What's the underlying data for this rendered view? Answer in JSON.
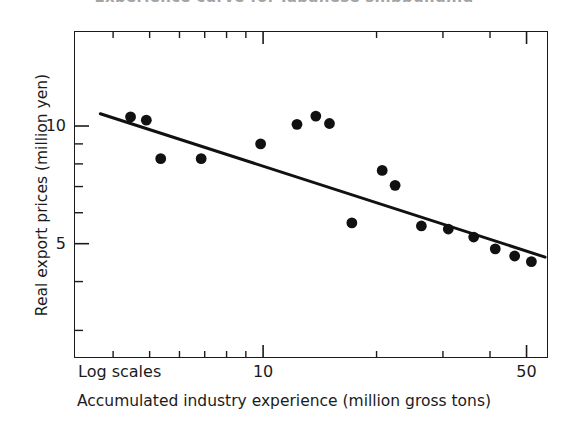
{
  "figure": {
    "cropped_title_remnant": "Experience curve for Japanese shipbuilding",
    "background_color": "#ffffff",
    "ink_color": "#1b1b1b"
  },
  "chart_data": {
    "type": "scatter",
    "title": "",
    "xlabel": "Accumulated industry experience (million gross tons)",
    "ylabel": "Real export prices (million yen)",
    "xscale": "log",
    "yscale": "log",
    "xlim": [
      3.15,
      57.0
    ],
    "ylim": [
      2.55,
      17.5
    ],
    "grid": false,
    "legend": null,
    "log_scale_note": "Log scales",
    "xticks_major": [
      10,
      50
    ],
    "xtick_labels": [
      "10",
      "50"
    ],
    "xticks_minor": [
      4,
      5,
      6,
      7,
      8,
      9,
      20,
      30,
      40,
      60
    ],
    "yticks_major": [
      5,
      10
    ],
    "ytick_labels": [
      "5",
      "10"
    ],
    "yticks_minor": [
      3,
      4,
      6,
      7,
      8,
      9
    ],
    "points": [
      {
        "x": 4.45,
        "y": 10.55
      },
      {
        "x": 4.9,
        "y": 10.35
      },
      {
        "x": 5.35,
        "y": 8.25
      },
      {
        "x": 6.85,
        "y": 8.25
      },
      {
        "x": 9.85,
        "y": 9.0
      },
      {
        "x": 12.3,
        "y": 10.1
      },
      {
        "x": 13.8,
        "y": 10.6
      },
      {
        "x": 15.0,
        "y": 10.15
      },
      {
        "x": 17.2,
        "y": 5.65
      },
      {
        "x": 20.7,
        "y": 7.7
      },
      {
        "x": 22.4,
        "y": 7.05
      },
      {
        "x": 26.3,
        "y": 5.55
      },
      {
        "x": 31.0,
        "y": 5.45
      },
      {
        "x": 36.2,
        "y": 5.2
      },
      {
        "x": 41.3,
        "y": 4.85
      },
      {
        "x": 46.5,
        "y": 4.65
      },
      {
        "x": 51.5,
        "y": 4.5
      }
    ],
    "series": [
      {
        "name": "Real export prices",
        "type": "scatter",
        "marker": "filled-circle",
        "color": "#111111"
      },
      {
        "name": "Fitted experience curve",
        "type": "line",
        "color": "#111111",
        "endpoints": [
          {
            "x": 3.7,
            "y": 10.75
          },
          {
            "x": 56.0,
            "y": 4.62
          }
        ]
      }
    ]
  },
  "axis": {
    "y_title": "Real export prices (million yen)",
    "x_title": "Accumulated industry experience (million gross tons)",
    "log_note": "Log scales",
    "y_labels": [
      {
        "value": 10,
        "text": "10"
      },
      {
        "value": 5,
        "text": "5"
      }
    ],
    "x_labels": [
      {
        "value": 10,
        "text": "10"
      },
      {
        "value": 50,
        "text": "50"
      }
    ]
  }
}
